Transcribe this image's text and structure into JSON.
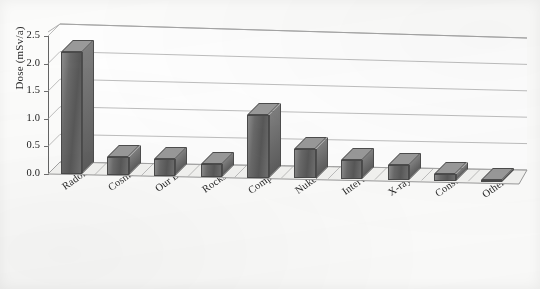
{
  "chart_data": {
    "type": "bar",
    "title": "",
    "subtitle": "",
    "xlabel": "",
    "ylabel": "Dose (mSv/a)",
    "ylim": [
      0.0,
      2.5
    ],
    "yticks": [
      "0.0",
      "0.5",
      "1.0",
      "1.5",
      "2.0",
      "2.5"
    ],
    "grid": true,
    "legend": "none",
    "three_d": true,
    "categories": [
      "Radon",
      "Cosmic Rays",
      "Our Bodies",
      "Rocks & Dirt",
      "Computed Tomography",
      "Nuke Med",
      "Interv. Fluoroscopy",
      "X-rays",
      "Consumer",
      "Other"
    ],
    "values": [
      2.22,
      0.33,
      0.31,
      0.24,
      1.16,
      0.55,
      0.35,
      0.28,
      0.13,
      0.02
    ],
    "series": [
      {
        "name": "Dose",
        "values": [
          2.22,
          0.33,
          0.31,
          0.24,
          1.16,
          0.55,
          0.35,
          0.28,
          0.13,
          0.02
        ]
      }
    ]
  },
  "style": {
    "bar_face": "#6a6a6a",
    "bar_top": "#9a9a9a",
    "bar_side": "#5d5d5d",
    "grid_color": "#9a9a9a",
    "axis_color": "#646464",
    "text_color": "#1f1f1f",
    "background": "#fdfdfc"
  }
}
